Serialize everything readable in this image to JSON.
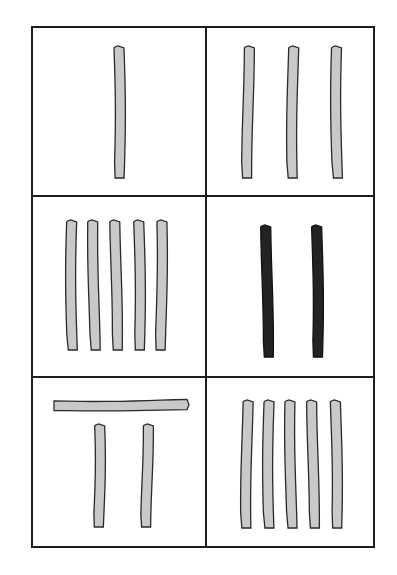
{
  "diagram": {
    "colors": {
      "background": "#ffffff",
      "grid_line": "#1e1e1e",
      "stick_light_fill": "#c9c9c9",
      "stick_dark_fill": "#232323",
      "stick_outline": "#2a2a2a"
    },
    "grid": {
      "rows": 3,
      "cols": 2,
      "frame": {
        "x1": 32,
        "y1": 27,
        "x2": 374,
        "y2": 547
      },
      "col_divider_x": 206,
      "row_divider_y": [
        196,
        377
      ]
    },
    "panels": [
      {
        "id": "panel-1",
        "row": 1,
        "col": 1,
        "vertical_sticks": 1,
        "horizontal_sticks": 0,
        "stick_color": "light",
        "sticks": [
          {
            "x": 114,
            "y1": 48,
            "y2": 178,
            "w": 10
          }
        ]
      },
      {
        "id": "panel-2",
        "row": 1,
        "col": 2,
        "vertical_sticks": 3,
        "horizontal_sticks": 0,
        "stick_color": "light",
        "sticks": [
          {
            "x": 243,
            "y1": 48,
            "y2": 178,
            "w": 10
          },
          {
            "x": 288,
            "y1": 48,
            "y2": 178,
            "w": 10
          },
          {
            "x": 332,
            "y1": 48,
            "y2": 178,
            "w": 10
          }
        ]
      },
      {
        "id": "panel-3",
        "row": 2,
        "col": 1,
        "vertical_sticks": 5,
        "horizontal_sticks": 0,
        "stick_color": "light",
        "sticks": [
          {
            "x": 67,
            "y1": 222,
            "y2": 350,
            "w": 10
          },
          {
            "x": 89,
            "y1": 222,
            "y2": 350,
            "w": 10
          },
          {
            "x": 111,
            "y1": 222,
            "y2": 350,
            "w": 10
          },
          {
            "x": 134,
            "y1": 222,
            "y2": 350,
            "w": 10
          },
          {
            "x": 156,
            "y1": 222,
            "y2": 350,
            "w": 10
          }
        ]
      },
      {
        "id": "panel-4",
        "row": 2,
        "col": 2,
        "vertical_sticks": 2,
        "horizontal_sticks": 0,
        "stick_color": "dark",
        "sticks": [
          {
            "x": 262,
            "y1": 227,
            "y2": 357,
            "w": 10
          },
          {
            "x": 312,
            "y1": 227,
            "y2": 357,
            "w": 10
          }
        ]
      },
      {
        "id": "panel-5",
        "row": 3,
        "col": 1,
        "vertical_sticks": 2,
        "horizontal_sticks": 1,
        "stick_color": "light",
        "horizontal": [
          {
            "x1": 54,
            "x2": 187,
            "y": 400,
            "h": 10
          }
        ],
        "sticks": [
          {
            "x": 94,
            "y1": 426,
            "y2": 527,
            "w": 10
          },
          {
            "x": 142,
            "y1": 426,
            "y2": 527,
            "w": 10
          }
        ]
      },
      {
        "id": "panel-6",
        "row": 3,
        "col": 2,
        "vertical_sticks": 5,
        "horizontal_sticks": 0,
        "stick_color": "light",
        "sticks": [
          {
            "x": 242,
            "y1": 402,
            "y2": 528,
            "w": 10
          },
          {
            "x": 264,
            "y1": 402,
            "y2": 528,
            "w": 10
          },
          {
            "x": 286,
            "y1": 402,
            "y2": 528,
            "w": 10
          },
          {
            "x": 308,
            "y1": 402,
            "y2": 528,
            "w": 10
          },
          {
            "x": 331,
            "y1": 402,
            "y2": 528,
            "w": 10
          }
        ]
      }
    ]
  }
}
